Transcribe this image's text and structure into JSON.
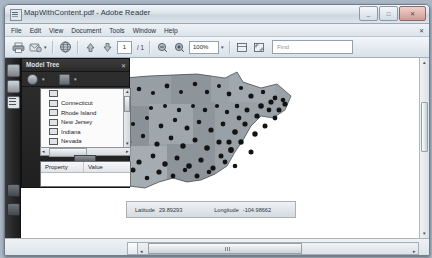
{
  "window": {
    "title": "MapWithContent.pdf - Adobe Reader",
    "app_icon": "pdf-document-icon",
    "minimize_label": "_",
    "maximize_label": "□",
    "close_label": "✕"
  },
  "menubar": {
    "items": [
      {
        "label": "File"
      },
      {
        "label": "Edit"
      },
      {
        "label": "View"
      },
      {
        "label": "Document"
      },
      {
        "label": "Tools"
      },
      {
        "label": "Window"
      },
      {
        "label": "Help"
      }
    ],
    "close_doc_label": "✕"
  },
  "toolbar": {
    "print_icon": "printer-icon",
    "email_icon": "email-document-icon",
    "email_caret": "▾",
    "globe_icon": "globe-icon",
    "prev_page_icon": "previous-page-icon",
    "next_page_icon": "next-page-icon",
    "page_current": "1",
    "page_total": "/ 1",
    "zoom_out_icon": "zoom-out-icon",
    "zoom_in_icon": "zoom-in-icon",
    "zoom_value": "100%",
    "zoom_caret": "▾",
    "fit_width_icon": "fit-width-icon",
    "fit_page_icon": "fit-page-icon",
    "find_placeholder": "Find",
    "find_value": "",
    "find_caret": "▾"
  },
  "navrail": {
    "items": [
      {
        "icon": "pages-thumbnail-icon"
      },
      {
        "icon": "bookmarks-icon"
      },
      {
        "icon": "layers-icon"
      },
      {
        "icon": "attachments-icon"
      },
      {
        "icon": "signatures-icon"
      }
    ]
  },
  "model_tree": {
    "title": "Model Tree",
    "close_label": "✕",
    "tools": [
      {
        "icon": "model-view-icon",
        "caret": "▾"
      },
      {
        "icon": "render-mode-icon",
        "caret": "▾"
      }
    ],
    "items": [
      {
        "label": "Connecticut",
        "checkbox": "checked"
      },
      {
        "label": "Rhode Island",
        "checkbox": "checked"
      },
      {
        "label": "New Jersey",
        "checkbox": "checked"
      },
      {
        "label": "Indiana",
        "checkbox": "checked"
      },
      {
        "label": "Nevada",
        "checkbox": "checked"
      }
    ],
    "scroll_up": "▴",
    "scroll_down": "▾",
    "scroll_left": "◂",
    "scroll_right": "▸",
    "properties": {
      "col_property": "Property",
      "col_value": "Value"
    }
  },
  "analysis_panel": {
    "title": "Analysis",
    "close_label": "✕",
    "tools": [
      {
        "icon": "3d-measurement-icon"
      },
      {
        "icon": "cross-section-icon"
      }
    ]
  },
  "map": {
    "coordinates": {
      "latitude_label": "Latitude",
      "latitude_value": "29.89293",
      "longitude_label": "Longitude",
      "longitude_value": "-104.98662"
    },
    "crosshair": "map-crosshair-marker"
  },
  "statusbar": {
    "page_size": "10.89 x 8.36 in",
    "page_size_caret": "▾",
    "scroll_left": "◂",
    "scroll_right": "▸"
  },
  "colors": {
    "chrome": "#dde4eb",
    "panel_dark": "#2a2a2a",
    "map_point": "#141414",
    "map_land": "#8f979e",
    "accent": "#6f7e8c"
  }
}
